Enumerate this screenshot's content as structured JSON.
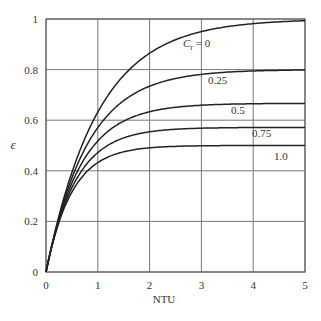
{
  "chart_data": {
    "type": "line",
    "title": "",
    "xlabel": "NTU",
    "ylabel": "ε",
    "xlim": [
      0,
      5
    ],
    "ylim": [
      0,
      1
    ],
    "grid": true,
    "x_ticks": [
      "0",
      "1",
      "2",
      "3",
      "4",
      "5"
    ],
    "y_ticks": [
      "0",
      "0.2",
      "0.4",
      "0.6",
      "0.8",
      "1"
    ],
    "x": [
      0,
      0.25,
      0.5,
      0.75,
      1,
      1.5,
      2,
      2.5,
      3,
      3.5,
      4,
      4.5,
      5
    ],
    "series": [
      {
        "name": "C_r = 0",
        "label": "C_r = 0",
        "values": [
          0,
          0.221,
          0.393,
          0.528,
          0.632,
          0.777,
          0.865,
          0.918,
          0.95,
          0.97,
          0.982,
          0.989,
          0.993
        ]
      },
      {
        "name": "0.25",
        "label": "0.25",
        "values": [
          0,
          0.215,
          0.371,
          0.488,
          0.571,
          0.677,
          0.733,
          0.764,
          0.781,
          0.79,
          0.795,
          0.797,
          0.798
        ]
      },
      {
        "name": "0.5",
        "label": "0.5",
        "values": [
          0,
          0.209,
          0.351,
          0.449,
          0.518,
          0.597,
          0.634,
          0.651,
          0.659,
          0.663,
          0.665,
          0.666,
          0.666
        ]
      },
      {
        "name": "0.75",
        "label": "0.75",
        "values": [
          0,
          0.202,
          0.333,
          0.416,
          0.471,
          0.53,
          0.555,
          0.565,
          0.569,
          0.57,
          0.571,
          0.571,
          0.571
        ]
      },
      {
        "name": "1.0",
        "label": "1.0",
        "values": [
          0,
          0.197,
          0.316,
          0.389,
          0.432,
          0.475,
          0.491,
          0.497,
          0.499,
          0.5,
          0.5,
          0.5,
          0.5
        ]
      }
    ],
    "annotations": [
      "C_r = 0",
      "0.25",
      "0.5",
      "0.75",
      "1.0"
    ]
  }
}
